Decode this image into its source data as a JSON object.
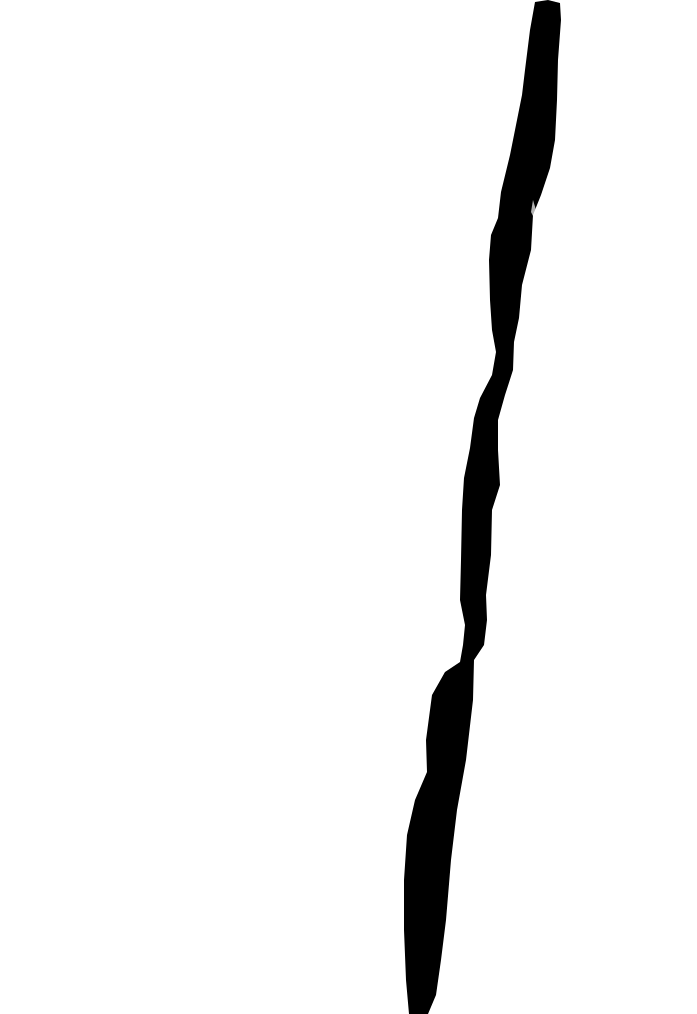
{
  "image": {
    "description": "Black vertical brush stroke on white background",
    "background_color": "#ffffff",
    "stroke_color": "#000000"
  }
}
